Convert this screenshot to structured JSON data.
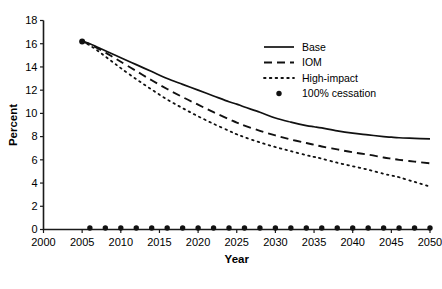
{
  "chart_data": {
    "type": "line",
    "title": "",
    "xlabel": "Year",
    "ylabel": "Percent",
    "xlim": [
      2000,
      2050
    ],
    "ylim": [
      0,
      18
    ],
    "xticks": [
      2000,
      2005,
      2010,
      2015,
      2020,
      2025,
      2030,
      2035,
      2040,
      2045,
      2050
    ],
    "yticks": [
      0,
      2,
      4,
      6,
      8,
      10,
      12,
      14,
      16,
      18
    ],
    "grid": false,
    "legend_position": "upper right",
    "x": [
      2005,
      2006,
      2007,
      2008,
      2009,
      2010,
      2012,
      2014,
      2016,
      2018,
      2020,
      2022,
      2024,
      2025,
      2026,
      2028,
      2030,
      2032,
      2034,
      2035,
      2036,
      2038,
      2040,
      2042,
      2044,
      2045,
      2046,
      2048,
      2050
    ],
    "series": [
      {
        "name": "Base",
        "style": "solid",
        "values": [
          16.2,
          16.0,
          15.7,
          15.4,
          15.1,
          14.8,
          14.2,
          13.6,
          13.0,
          12.5,
          12.0,
          11.5,
          11.0,
          10.8,
          10.55,
          10.1,
          9.6,
          9.25,
          8.95,
          8.85,
          8.75,
          8.5,
          8.3,
          8.15,
          8.0,
          7.95,
          7.9,
          7.85,
          7.8
        ]
      },
      {
        "name": "IOM",
        "style": "dashed",
        "values": [
          16.2,
          15.95,
          15.6,
          15.25,
          14.85,
          14.45,
          13.65,
          12.85,
          12.1,
          11.4,
          10.75,
          10.1,
          9.5,
          9.2,
          8.95,
          8.5,
          8.1,
          7.75,
          7.45,
          7.3,
          7.15,
          6.9,
          6.65,
          6.45,
          6.2,
          6.1,
          6.0,
          5.85,
          5.7
        ]
      },
      {
        "name": "High-impact",
        "style": "dotted",
        "values": [
          16.2,
          15.85,
          15.4,
          14.9,
          14.4,
          13.9,
          12.95,
          12.05,
          11.2,
          10.45,
          9.75,
          9.1,
          8.5,
          8.2,
          7.95,
          7.5,
          7.1,
          6.75,
          6.4,
          6.25,
          6.1,
          5.75,
          5.45,
          5.15,
          4.8,
          4.65,
          4.5,
          4.1,
          3.7
        ]
      }
    ],
    "marker_series": {
      "name": "100% cessation",
      "style": "dot-marker",
      "x": [
        2006,
        2008,
        2010,
        2012,
        2014,
        2016,
        2018,
        2020,
        2022,
        2024,
        2026,
        2028,
        2030,
        2032,
        2034,
        2036,
        2038,
        2040,
        2042,
        2044,
        2046,
        2048,
        2050
      ],
      "values": [
        0,
        0,
        0,
        0,
        0,
        0,
        0,
        0,
        0,
        0,
        0,
        0,
        0,
        0,
        0,
        0,
        0,
        0,
        0,
        0,
        0,
        0,
        0
      ]
    },
    "start_marker": {
      "x": 2005,
      "y": 16.2
    },
    "legend": [
      {
        "label": "Base",
        "style": "solid"
      },
      {
        "label": "IOM",
        "style": "dashed"
      },
      {
        "label": "High-impact",
        "style": "dotted"
      },
      {
        "label": "100% cessation",
        "style": "dot-marker"
      }
    ],
    "colors": {
      "line": "#111111",
      "axis": "#1a1a1a",
      "background": "#ffffff"
    }
  }
}
